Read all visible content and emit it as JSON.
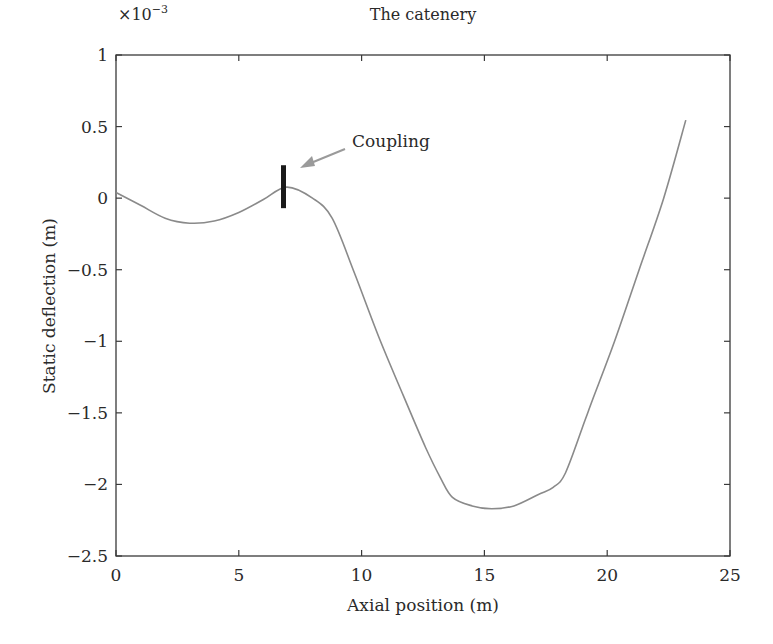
{
  "chart_data": {
    "type": "line",
    "title": "The catenery",
    "xlabel": "Axial position (m)",
    "ylabel": "Static deflection (m)",
    "y_exponent_label": "×10",
    "y_exponent_power": "−3",
    "xlim": [
      0,
      25
    ],
    "ylim": [
      -2.5,
      1
    ],
    "xticks": [
      0,
      5,
      10,
      15,
      20,
      25
    ],
    "xtick_labels": [
      "0",
      "5",
      "10",
      "15",
      "20",
      "25"
    ],
    "yticks": [
      1,
      0.5,
      0,
      -0.5,
      -1,
      -1.5,
      -2,
      -2.5
    ],
    "ytick_labels": [
      "1",
      "0.5",
      "0",
      "−0.5",
      "−1",
      "−1.5",
      "−2",
      "−2.5"
    ],
    "grid": false,
    "series": [
      {
        "name": "Static deflection",
        "color": "#8a8a8a",
        "x": [
          0,
          1,
          2,
          3,
          4,
          5,
          6,
          6.95,
          8,
          8.8,
          9.7,
          10.7,
          11.7,
          12.6,
          13.2,
          13.7,
          14.5,
          15.3,
          16.2,
          17.2,
          17.8,
          18.3,
          19.1,
          19.4,
          20.3,
          21.3,
          22.3,
          23.2
        ],
        "values": [
          0.04,
          -0.05,
          -0.14,
          -0.175,
          -0.16,
          -0.1,
          -0.01,
          0.077,
          0.0,
          -0.14,
          -0.52,
          -0.97,
          -1.38,
          -1.74,
          -1.95,
          -2.09,
          -2.15,
          -2.17,
          -2.15,
          -2.07,
          -2.02,
          -1.92,
          -1.55,
          -1.41,
          -1.0,
          -0.5,
          0.0,
          0.545
        ]
      }
    ],
    "annotations": [
      {
        "text": "Coupling",
        "type": "arrow",
        "target_x": 6.8,
        "target_y": 0.09
      },
      {
        "text": "",
        "type": "bar-marker",
        "x": 6.8,
        "y_top": 0.23,
        "y_bottom": -0.07,
        "color": "#1a1a1a"
      }
    ]
  }
}
